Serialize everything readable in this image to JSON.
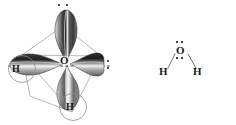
{
  "figure": {
    "background_color": "#ffffff",
    "width": 236,
    "height": 125,
    "ink_color": "#1a1a1a",
    "wireframe_color": "#8a8a8a",
    "molecule": "H2O"
  },
  "orbital_model": {
    "center_atom_label": "O",
    "hydrogen_left_label": "H",
    "hydrogen_bottom_label": "H",
    "lone_pair_top": "¨",
    "lone_pair_right": ":",
    "lone_pair_top_dot_count": 2,
    "lone_pair_right_dot_count": 2,
    "lobe_count": 4,
    "lobe_names": [
      "top-lobe",
      "left-lobe",
      "right-lobe",
      "bottom-lobe"
    ],
    "geometry": "tetrahedral",
    "hybridization": "sp3",
    "has_dashed_axis": true,
    "has_tetrahedral_wireframe": true
  },
  "lewis_structure": {
    "center_atom_label": "O",
    "hydrogen_left_label": "H",
    "hydrogen_right_label": "H",
    "lone_pair_top_dot_count": 2,
    "lone_pair_bottom_dot_count": 2,
    "bond_count": 2,
    "shape": "bent"
  }
}
